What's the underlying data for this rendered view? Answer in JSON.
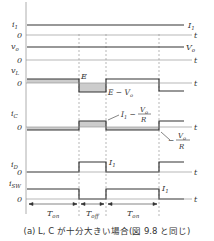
{
  "figure": {
    "caption": "(a) L, C が十分大きい場合(図 9.8 と同じ)",
    "time_axis_label": "t",
    "zero_label": "0",
    "waveforms": [
      {
        "name": "i1",
        "ylabel": "i₁",
        "right_label": "I₁"
      },
      {
        "name": "vo",
        "ylabel": "vₒ",
        "right_label": "Vₒ"
      },
      {
        "name": "vL",
        "ylabel": "v_L",
        "high_label": "E",
        "low_label": "E − Vₒ"
      },
      {
        "name": "iC",
        "ylabel": "i_C",
        "high_label": "I₁ − Vₒ/R",
        "low_label": "− Vₒ/R"
      },
      {
        "name": "iD",
        "ylabel": "i_D",
        "level_label": "I₁"
      },
      {
        "name": "iSW",
        "ylabel": "i_SW",
        "level_label": "I₁"
      }
    ],
    "intervals": [
      "T_on",
      "T_off",
      "T_on"
    ],
    "colors": {
      "line": "#333333",
      "shade": "#cccccc",
      "dash": "#888888",
      "axis": "#999999"
    }
  }
}
